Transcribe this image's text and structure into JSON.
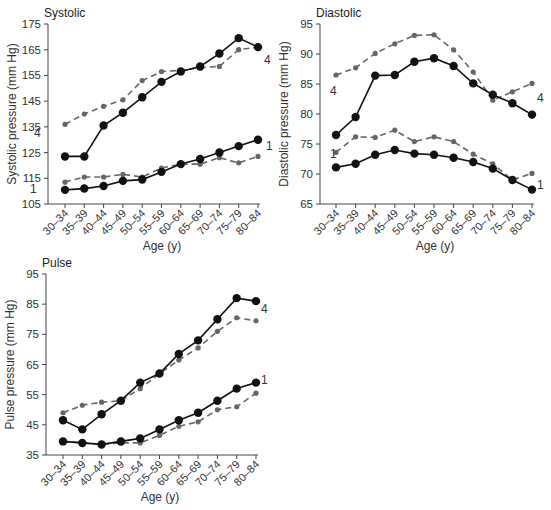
{
  "chart_data": [
    {
      "type": "line",
      "title": "Systolic",
      "xlabel": "Age (y)",
      "ylabel": "Systolic pressure (mm Hg)",
      "ylim": [
        105,
        175
      ],
      "yticks": [
        105,
        115,
        125,
        135,
        145,
        155,
        165,
        175
      ],
      "grid": false,
      "categories": [
        "30–34",
        "35–39",
        "40–44",
        "45–49",
        "50–54",
        "55–59",
        "60–64",
        "65–69",
        "70–74",
        "75–79",
        "80–84"
      ],
      "series": [
        {
          "name": "4 (solid)",
          "style": "solid",
          "label": "4",
          "values": [
            123.5,
            123.5,
            135.5,
            140.5,
            146.5,
            152.5,
            156.5,
            158.5,
            163.5,
            169.5,
            166
          ]
        },
        {
          "name": "4 (dashed)",
          "style": "dashed",
          "label": "4",
          "values": [
            136,
            140,
            143,
            145.5,
            153,
            156.5,
            157,
            158,
            158.5,
            165,
            166
          ]
        },
        {
          "name": "1 (solid)",
          "style": "solid",
          "label": "1",
          "values": [
            110.5,
            111,
            112,
            114,
            114.5,
            117.5,
            120.5,
            122.5,
            125,
            127.5,
            130
          ]
        },
        {
          "name": "1 (dashed)",
          "style": "dashed",
          "label": "1",
          "values": [
            113.5,
            115.5,
            115.5,
            116.5,
            115.5,
            119,
            120.5,
            120.5,
            123,
            121,
            123.5
          ]
        }
      ],
      "annotations": [
        {
          "text": "4",
          "position": "left of 30–34, near dashed 4 line"
        },
        {
          "text": "4",
          "position": "right of 80–84"
        },
        {
          "text": "1",
          "position": "left of 30–34, near lower lines"
        },
        {
          "text": "1",
          "position": "right of 80–84"
        }
      ]
    },
    {
      "type": "line",
      "title": "Diastolic",
      "xlabel": "Age (y)",
      "ylabel": "Diastolic pressure (mm Hg)",
      "ylim": [
        65,
        95
      ],
      "yticks": [
        65,
        70,
        75,
        80,
        85,
        90,
        95
      ],
      "grid": false,
      "categories": [
        "30–34",
        "35–39",
        "40–44",
        "45–49",
        "50–54",
        "55–59",
        "60–64",
        "65–69",
        "70–74",
        "75–79",
        "80–84"
      ],
      "series": [
        {
          "name": "4 (solid)",
          "style": "solid",
          "label": "4",
          "values": [
            76.5,
            79.5,
            86.4,
            86.5,
            88.7,
            89.3,
            88,
            85.1,
            83.2,
            81.8,
            79.9
          ]
        },
        {
          "name": "4 (dashed)",
          "style": "dashed",
          "label": "4",
          "values": [
            86.5,
            87.7,
            90.1,
            91.7,
            93.1,
            93.2,
            90.7,
            87,
            82.3,
            83.7,
            85.1
          ]
        },
        {
          "name": "1 (solid)",
          "style": "solid",
          "label": "1",
          "values": [
            71.1,
            71.7,
            73.2,
            74,
            73.4,
            73.2,
            72.7,
            72,
            70.9,
            69,
            67.4
          ]
        },
        {
          "name": "1 (dashed)",
          "style": "dashed",
          "label": "1",
          "values": [
            73.6,
            76.2,
            76.1,
            77.3,
            75.4,
            76.2,
            75.4,
            73.3,
            71.7,
            69,
            70.1
          ]
        }
      ],
      "annotations": [
        {
          "text": "4",
          "position": "left of 30–34"
        },
        {
          "text": "4",
          "position": "right of 80–84"
        },
        {
          "text": "1",
          "position": "left of 30–34"
        },
        {
          "text": "1",
          "position": "right of 80–84"
        }
      ]
    },
    {
      "type": "line",
      "title": "Pulse",
      "xlabel": "Age (y)",
      "ylabel": "Pulse pressure (mm Hg)",
      "ylim": [
        35,
        95
      ],
      "yticks": [
        35,
        45,
        55,
        65,
        75,
        85,
        95
      ],
      "grid": false,
      "categories": [
        "30–34",
        "35–39",
        "40–44",
        "45–49",
        "50–54",
        "55–59",
        "60–64",
        "65–69",
        "70–74",
        "75–79",
        "80–84"
      ],
      "series": [
        {
          "name": "4 (solid)",
          "style": "solid",
          "label": "4",
          "values": [
            46.5,
            43.5,
            48.5,
            53,
            59,
            62,
            68.5,
            73,
            80,
            87,
            86
          ]
        },
        {
          "name": "4 (dashed)",
          "style": "dashed",
          "label": "4",
          "values": [
            49,
            51.5,
            52.5,
            53,
            57,
            62,
            66.5,
            70.5,
            76,
            80.5,
            79.5
          ]
        },
        {
          "name": "1 (solid)",
          "style": "solid",
          "label": "1",
          "values": [
            39.5,
            39,
            38.5,
            39.5,
            40.5,
            43.5,
            46.5,
            49,
            53,
            57,
            59
          ]
        },
        {
          "name": "1 (dashed)",
          "style": "dashed",
          "label": "1",
          "values": [
            39.5,
            39,
            38.5,
            39,
            39,
            41.5,
            44.5,
            46,
            50,
            51,
            55.5
          ]
        }
      ],
      "annotations": [
        {
          "text": "4",
          "position": "right of 80–84"
        },
        {
          "text": "1",
          "position": "right of 80–84"
        }
      ]
    }
  ],
  "layout": [
    {
      "x0": 48,
      "y0": 24,
      "y1": 204,
      "xFirst": 65,
      "xStep": 19.3,
      "xAxisEnd": 260,
      "labels": [
        {
          "text": "4",
          "x": 34,
          "y": 137
        },
        {
          "text": "4",
          "x": 264,
          "y": 64
        },
        {
          "text": "1",
          "x": 30,
          "y": 193
        },
        {
          "text": "1",
          "x": 266,
          "y": 150
        }
      ]
    },
    {
      "x0": 320,
      "y0": 24,
      "y1": 204,
      "xFirst": 336,
      "xStep": 19.6,
      "xAxisEnd": 534,
      "labels": [
        {
          "text": "4",
          "x": 330,
          "y": 95
        },
        {
          "text": "4",
          "x": 537,
          "y": 102
        },
        {
          "text": "1",
          "x": 330,
          "y": 158
        },
        {
          "text": "1",
          "x": 537,
          "y": 189
        }
      ]
    },
    {
      "x0": 46,
      "y0": 274,
      "y1": 455,
      "xFirst": 63,
      "xStep": 19.3,
      "xAxisEnd": 258,
      "labels": [
        {
          "text": "4",
          "x": 261,
          "y": 313
        },
        {
          "text": "1",
          "x": 261,
          "y": 384
        }
      ]
    }
  ],
  "colors": {
    "solid": "#111111",
    "dashed": "#666666",
    "axis": "#444444"
  }
}
